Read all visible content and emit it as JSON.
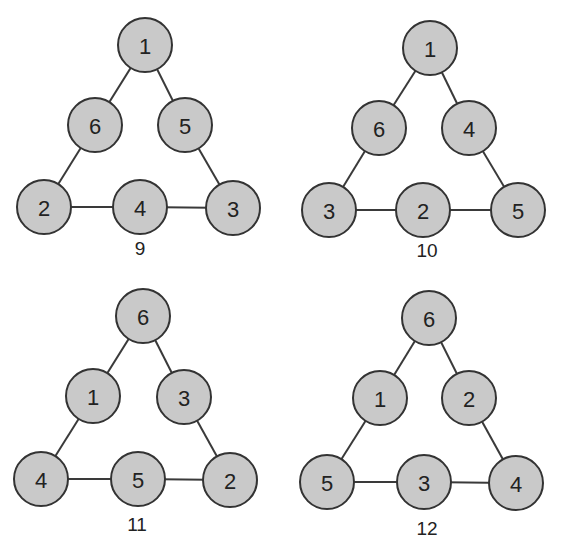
{
  "style": {
    "node_fill": "#c9c9c9",
    "node_stroke": "#333333",
    "edge_color": "#3a3a3a",
    "node_radius": 27
  },
  "diagrams": [
    {
      "caption": "9",
      "caption_pos": [
        140,
        248
      ],
      "nodes": [
        {
          "label": "1",
          "x": 145,
          "y": 45
        },
        {
          "label": "6",
          "x": 95,
          "y": 125
        },
        {
          "label": "5",
          "x": 185,
          "y": 125
        },
        {
          "label": "2",
          "x": 44,
          "y": 207
        },
        {
          "label": "4",
          "x": 140,
          "y": 207
        },
        {
          "label": "3",
          "x": 233,
          "y": 208
        }
      ]
    },
    {
      "caption": "10",
      "caption_pos": [
        427,
        250
      ],
      "nodes": [
        {
          "label": "1",
          "x": 430,
          "y": 48
        },
        {
          "label": "6",
          "x": 379,
          "y": 128
        },
        {
          "label": "4",
          "x": 469,
          "y": 128
        },
        {
          "label": "3",
          "x": 329,
          "y": 210
        },
        {
          "label": "2",
          "x": 423,
          "y": 210
        },
        {
          "label": "5",
          "x": 518,
          "y": 210
        }
      ]
    },
    {
      "caption": "11",
      "caption_pos": [
        137,
        524
      ],
      "nodes": [
        {
          "label": "6",
          "x": 143,
          "y": 316
        },
        {
          "label": "1",
          "x": 93,
          "y": 396
        },
        {
          "label": "3",
          "x": 184,
          "y": 397
        },
        {
          "label": "4",
          "x": 41,
          "y": 479
        },
        {
          "label": "5",
          "x": 138,
          "y": 479
        },
        {
          "label": "2",
          "x": 230,
          "y": 480
        }
      ]
    },
    {
      "caption": "12",
      "caption_pos": [
        427,
        528
      ],
      "nodes": [
        {
          "label": "6",
          "x": 429,
          "y": 318
        },
        {
          "label": "1",
          "x": 380,
          "y": 398
        },
        {
          "label": "2",
          "x": 469,
          "y": 398
        },
        {
          "label": "5",
          "x": 327,
          "y": 482
        },
        {
          "label": "3",
          "x": 424,
          "y": 482
        },
        {
          "label": "4",
          "x": 516,
          "y": 483
        }
      ]
    }
  ],
  "edges_by_index": [
    [
      0,
      1
    ],
    [
      0,
      2
    ],
    [
      1,
      3
    ],
    [
      2,
      5
    ],
    [
      3,
      4
    ],
    [
      4,
      5
    ]
  ]
}
